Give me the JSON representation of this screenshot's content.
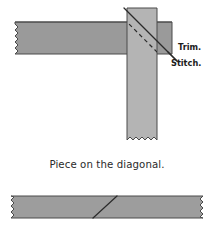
{
  "figure": {
    "title": "Piece on the diagonal",
    "caption": "Piece on the diagonal.",
    "background_color": "#ffffff",
    "labels": {
      "trim": "Trim.",
      "stitch": "Stitch."
    },
    "colors": {
      "background": "#ffffff",
      "horizontal_strip_fill": "#9a9a9a",
      "vertical_strip_fill": "#b4b4b4",
      "bottom_strip_fill": "#9d9d9d",
      "strip_outline": "#4a4a4a",
      "trim_line": "#2a2a2a",
      "stitch_line": "#2a2a2a",
      "seam_line": "#2b2b2b",
      "label_text": "#1c1c1c",
      "caption_text": "#2a2a2a"
    },
    "top_diagram": {
      "name": "diagonal-seam-construction",
      "horizontal_strip": {
        "label": "horizontal fabric strip",
        "x": 15,
        "y": 22,
        "width": 157,
        "height": 32,
        "raw_edge": "left",
        "fill": "#9a9a9a"
      },
      "vertical_strip": {
        "label": "vertical fabric strip",
        "x": 127,
        "y": 8,
        "width": 30,
        "height": 132,
        "raw_edge": "bottom",
        "fill": "#b4b4b4"
      },
      "trim_line": {
        "label": "Trim.",
        "style": "solid",
        "x1": 124,
        "y1": 8,
        "x2": 176,
        "y2": 60
      },
      "stitch_line": {
        "label": "Stitch.",
        "style": "dashed",
        "x1": 127,
        "y1": 22,
        "x2": 159,
        "y2": 54
      },
      "trim_label_position": {
        "x": 178,
        "y": 47
      },
      "stitch_label_position": {
        "x": 172,
        "y": 62
      }
    },
    "bottom_diagram": {
      "name": "joined-strip-result",
      "strip": {
        "label": "joined fabric strip",
        "x": 11,
        "y": 196,
        "width": 192,
        "height": 22,
        "raw_edge": "both-ends",
        "fill": "#9d9d9d"
      },
      "diagonal_seam": {
        "label": "diagonal seam",
        "x1": 93,
        "y1": 218,
        "x2": 117,
        "y2": 196
      }
    }
  }
}
